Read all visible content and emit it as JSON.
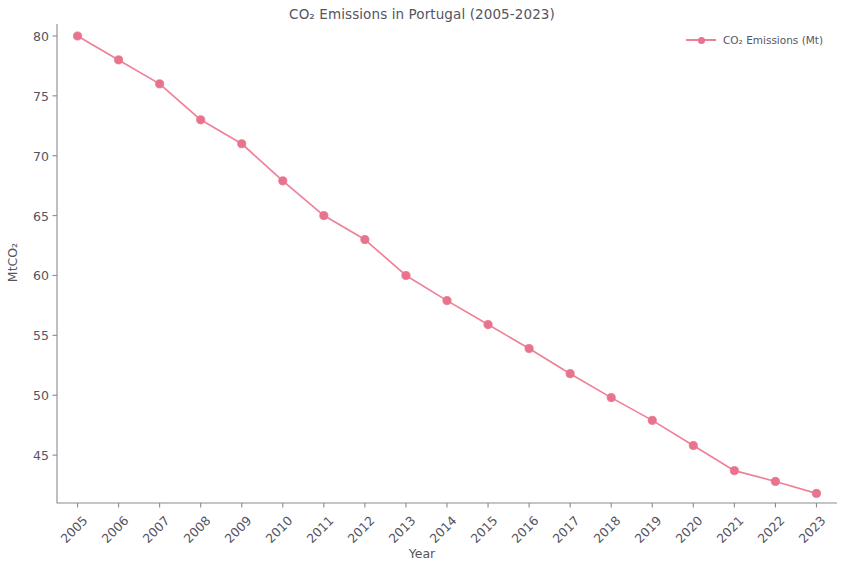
{
  "chart_data": {
    "type": "line",
    "title": "CO₂ Emissions in Portugal (2005-2023)",
    "xlabel": "Year",
    "ylabel": "MtCO₂",
    "categories": [
      "2005",
      "2006",
      "2007",
      "2008",
      "2009",
      "2010",
      "2011",
      "2012",
      "2013",
      "2014",
      "2015",
      "2016",
      "2017",
      "2018",
      "2019",
      "2020",
      "2021",
      "2022",
      "2023"
    ],
    "x": [
      2005,
      2006,
      2007,
      2008,
      2009,
      2010,
      2011,
      2012,
      2013,
      2014,
      2015,
      2016,
      2017,
      2018,
      2019,
      2020,
      2021,
      2022,
      2023
    ],
    "series": [
      {
        "name": "CO₂ Emissions (Mt)",
        "values": [
          80.0,
          78.0,
          76.0,
          73.0,
          71.0,
          67.9,
          65.0,
          63.0,
          60.0,
          57.9,
          55.9,
          53.9,
          51.8,
          49.8,
          47.9,
          45.8,
          43.7,
          42.8,
          41.8
        ],
        "color": "#f08098",
        "marker": "circle",
        "linestyle": "solid"
      }
    ],
    "ylim": [
      41.0,
      81.0
    ],
    "xlim": [
      2004.5,
      2023.5
    ],
    "yticks": [
      45,
      50,
      55,
      60,
      65,
      70,
      75,
      80
    ],
    "ytick_labels": [
      "45",
      "50",
      "55",
      "60",
      "65",
      "70",
      "75",
      "80"
    ],
    "xtick_labels": [
      "2005",
      "2006",
      "2007",
      "2008",
      "2009",
      "2010",
      "2011",
      "2012",
      "2013",
      "2014",
      "2015",
      "2016",
      "2017",
      "2018",
      "2019",
      "2020",
      "2021",
      "2022",
      "2023"
    ],
    "xtick_rotation": -45,
    "grid": false,
    "legend_position": "upper right",
    "legend_entries": [
      "CO₂ Emissions (Mt)"
    ],
    "annotations": []
  },
  "legend": {
    "label": "CO₂ Emissions (Mt)"
  },
  "colors": {
    "line": "#f08098",
    "marker": "#e8738e",
    "axis": "#8a8a94",
    "text": "#55555f",
    "background": "#ffffff"
  }
}
